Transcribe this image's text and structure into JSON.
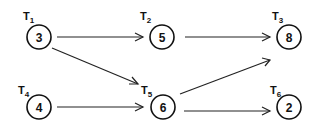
{
  "diagram": {
    "type": "task-dependency-graph",
    "nodes": [
      {
        "id": "T1",
        "label": "T",
        "sub": "1",
        "value": "3",
        "cx": 39,
        "cy": 37
      },
      {
        "id": "T2",
        "label": "T",
        "sub": "2",
        "value": "5",
        "cx": 162,
        "cy": 37
      },
      {
        "id": "T3",
        "label": "T",
        "sub": "3",
        "value": "8",
        "cx": 289,
        "cy": 37
      },
      {
        "id": "T4",
        "label": "T",
        "sub": "4",
        "value": "4",
        "cx": 39,
        "cy": 107
      },
      {
        "id": "T5",
        "label": "T",
        "sub": "5",
        "value": "6",
        "cx": 163,
        "cy": 107
      },
      {
        "id": "T6",
        "label": "T",
        "sub": "6",
        "value": "2",
        "cx": 289,
        "cy": 107
      }
    ],
    "edges": [
      {
        "from": "T1",
        "to": "T2"
      },
      {
        "from": "T1",
        "to": "T5"
      },
      {
        "from": "T2",
        "to": "T3"
      },
      {
        "from": "T4",
        "to": "T5"
      },
      {
        "from": "T5",
        "to": "T3"
      },
      {
        "from": "T5",
        "to": "T6"
      }
    ]
  }
}
